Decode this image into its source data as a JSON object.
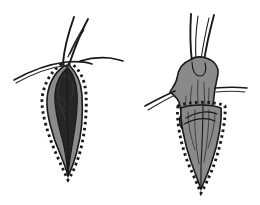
{
  "figure": {
    "background_color": "#ffffff",
    "ink_color": "#1a1a1a",
    "fill_gray": "#8a8a8a",
    "fill_gray_dark": "#6f6f6f",
    "fill_dark": "#262626",
    "dot_color": "#1c1c1c",
    "panels": [
      {
        "id": "panel-left",
        "name": "left-panel",
        "label": "",
        "elements": [
          {
            "name": "skin-surface-line",
            "type": "curve",
            "label": ""
          },
          {
            "name": "hair-strand-1",
            "type": "strand",
            "label": ""
          },
          {
            "name": "hair-strand-2",
            "type": "strand",
            "label": ""
          },
          {
            "name": "hair-strand-3",
            "type": "strand",
            "label": ""
          },
          {
            "name": "excision-margin-dotted-outline",
            "type": "dotted-outline",
            "label": ""
          },
          {
            "name": "lesion-gray-body",
            "type": "filled-shape",
            "label": ""
          },
          {
            "name": "lesion-dark-core",
            "type": "filled-shape",
            "label": ""
          },
          {
            "name": "follicle-shaft",
            "type": "line",
            "label": ""
          }
        ]
      },
      {
        "id": "panel-right",
        "name": "right-panel",
        "label": "",
        "elements": [
          {
            "name": "hair-strand-1",
            "type": "strand",
            "label": ""
          },
          {
            "name": "hair-strand-2",
            "type": "strand",
            "label": ""
          },
          {
            "name": "everted-tissue-mass",
            "type": "filled-shape",
            "label": ""
          },
          {
            "name": "skin-surface-line-left",
            "type": "curve",
            "label": ""
          },
          {
            "name": "skin-surface-line-right",
            "type": "curve",
            "label": ""
          },
          {
            "name": "retracted-skin-loop",
            "type": "curve",
            "label": ""
          },
          {
            "name": "excision-margin-dotted-outline",
            "type": "dotted-outline",
            "label": ""
          },
          {
            "name": "lesion-gray-wedge",
            "type": "filled-shape",
            "label": ""
          },
          {
            "name": "follicle-shaft",
            "type": "line",
            "label": ""
          }
        ]
      }
    ]
  }
}
